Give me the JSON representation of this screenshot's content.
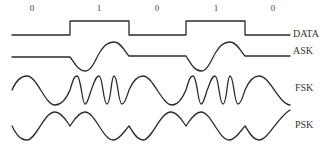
{
  "diagram": {
    "bits": [
      "0",
      "1",
      "0",
      "1",
      "0"
    ],
    "signals": [
      {
        "id": "data",
        "label": "DATA"
      },
      {
        "id": "ask",
        "label": "ASK"
      },
      {
        "id": "fsk",
        "label": "FSK"
      },
      {
        "id": "psk",
        "label": "PSK"
      }
    ],
    "colors": {
      "stroke": "#2a2a2a",
      "background": "#ffffff"
    }
  }
}
